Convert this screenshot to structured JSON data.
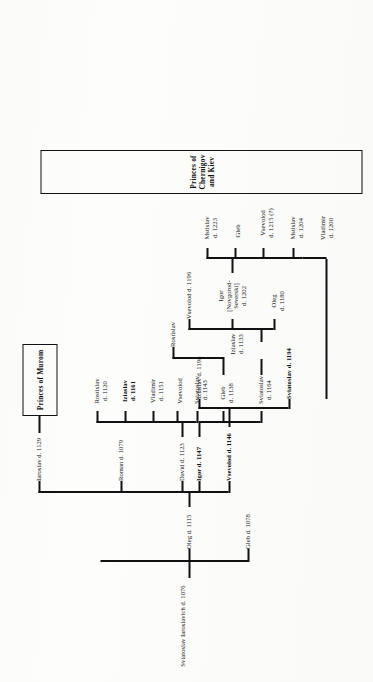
{
  "figure": {
    "caption": "Table XXX. Descendants of Sviatoslav Iaroslavich, princes of Chernigov and Murom"
  },
  "boxes": {
    "murom": "Princes of Murom",
    "chernigov": "Princes of Chernigov and Kiev"
  },
  "persons": {
    "root": "Sviatoslav Iaroslavich d. 1076",
    "gleb_1078": "Gleb d. 1078",
    "oleg_1115": "Oleg d. 1115",
    "iaroslav_1129": "Iaroslav d. 1129",
    "roman_1079": "Roman d. 1079",
    "david_1123": "David d. 1123",
    "vsevolod_1146": "Vsevolod d. 1146",
    "igor_1147": "Igor d. 1147",
    "rostislav_1120": "Rostislav\nd. 1120",
    "iziaslav_1161": "Iziaslav\nd. 1161",
    "vladimir_1151": "Vladimir\nd. 1151",
    "vsevolod_plain": "Vsevolod",
    "sviatoslav_1143": "Sviatoslav\nd. 1143",
    "gleb_1138": "Gleb\nd. 1138",
    "sviatoslav_1164": "Sviatoslav\nd. 1164",
    "iziaslav_1198": "Iziaslav d. 1198",
    "sviatoslav_1194": "Sviatoslav d. 1194",
    "rostislav_plain": "Rostislav",
    "iziaslav_1133": "Iziaslav\nd. 1133",
    "vsevolod_1196": "Vsevolod d. 1196",
    "igor_novgorod": "Igor\n[Novgorod-\nSeverski]\nd. 1202",
    "oleg_1180": "Oleg\nd. 1180",
    "mstislav_1223": "Mstislav\nd. 1223",
    "gleb_plain": "Gleb",
    "vsevolod_1215": "Vsevolod\nd. 1215 (?)",
    "mstislav_1204": "Mstislav\nd. 1204",
    "vladimir_1200": "Vladimir\nd. 1200"
  },
  "colors": {
    "ink": "#111111",
    "paper": "#fdfdfc"
  }
}
